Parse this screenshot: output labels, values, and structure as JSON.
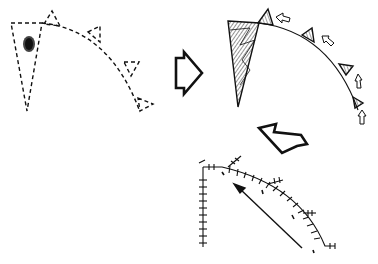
{
  "diagram": {
    "type": "process-sequence",
    "stages": [
      {
        "id": "stage-1",
        "name": "dashed-outline-sector",
        "style": "dashed"
      },
      {
        "id": "stage-2",
        "name": "hatched-sector-with-growth-arrows",
        "style": "hatched"
      },
      {
        "id": "stage-3",
        "name": "crosshatched-curve-with-arrow",
        "style": "ticked"
      }
    ],
    "transitions": [
      {
        "from": "stage-1",
        "to": "stage-2",
        "direction": "right"
      },
      {
        "from": "stage-2",
        "to": "stage-3",
        "direction": "down-left"
      }
    ],
    "colors": {
      "stroke": "#111111",
      "background": "#ffffff",
      "blob": "#333333"
    }
  }
}
